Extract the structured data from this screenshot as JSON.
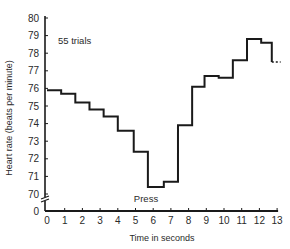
{
  "chart_data": {
    "type": "line",
    "subtype": "step",
    "title": "",
    "annotation_trials": "55 trials",
    "annotation_press": "Press",
    "xlabel": "Time in seconds",
    "ylabel": "Heart rate (beats per minute)",
    "xlim": [
      0,
      13
    ],
    "ylim": [
      70,
      80
    ],
    "y_axis_break": "between 0 and 70",
    "x_ticks": [
      "0",
      "1",
      "2",
      "3",
      "4",
      "5",
      "6",
      "7",
      "8",
      "9",
      "10",
      "11",
      "12",
      "13"
    ],
    "y_ticks": [
      "0",
      "70",
      "71",
      "72",
      "73",
      "74",
      "75",
      "76",
      "77",
      "78",
      "79",
      "80"
    ],
    "grid": false,
    "legend": null,
    "series": [
      {
        "name": "Heart rate",
        "interval_s": 0.8,
        "x_start": [
          0.0,
          0.8,
          1.6,
          2.4,
          3.2,
          4.0,
          4.9,
          5.7,
          6.6,
          7.4,
          8.2,
          8.9,
          9.7,
          10.5,
          11.3,
          12.1
        ],
        "values": [
          75.9,
          75.7,
          75.2,
          74.8,
          74.4,
          73.6,
          72.4,
          70.4,
          70.7,
          73.9,
          76.1,
          76.7,
          76.6,
          77.6,
          78.8,
          78.6
        ],
        "x_end": 12.7,
        "trailing_dashed_value": 77.5,
        "trailing_dashed_range": [
          12.7,
          13.2
        ]
      }
    ]
  },
  "layout": {
    "line_color": "#1a1a1a",
    "axis_color": "#1a1a1a"
  }
}
